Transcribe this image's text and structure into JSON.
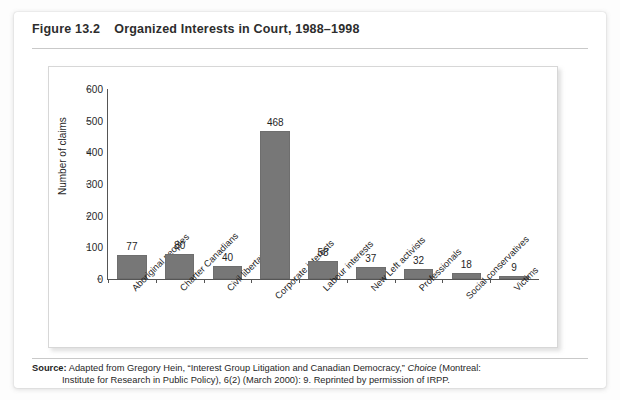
{
  "figure": {
    "number": "Figure 13.2",
    "title": "Organized Interests in Court, 1988–1998",
    "source_label": "Source:",
    "source_line1_a": " Adapted from Gregory Hein, “Interest Group Litigation and Canadian Democracy,” ",
    "source_line1_italic": "Choice",
    "source_line1_b": " (Montreal:",
    "source_line2": "Institute for Research in Public Policy), 6(2) (March 2000): 9. Reprinted by permission of IRPP."
  },
  "colors": {
    "bar_fill": "#777777",
    "bar_stroke": "#6e6e6e",
    "axis": "#555555",
    "text": "#1f1f1f",
    "card_background": "#ffffff",
    "rule": "#c9c9c9"
  },
  "chart_data": {
    "type": "bar",
    "title": "Organized Interests in Court, 1988–1998",
    "xlabel": "",
    "ylabel": "Number of claims",
    "ylim": [
      0,
      600
    ],
    "yticks": [
      0,
      100,
      200,
      300,
      400,
      500,
      600
    ],
    "grid": false,
    "legend": "none",
    "categories": [
      "Aboriginal peoples",
      "Charter Canadians",
      "Civil libertarians",
      "Corporate interests",
      "Labour interests",
      "New Left activists",
      "Professionals",
      "Social conservatives",
      "Victims"
    ],
    "values": [
      77,
      80,
      40,
      468,
      58,
      37,
      32,
      18,
      9
    ],
    "data_labels": [
      "77",
      "80",
      "40",
      "468",
      "58",
      "37",
      "32",
      "18",
      "9"
    ]
  }
}
